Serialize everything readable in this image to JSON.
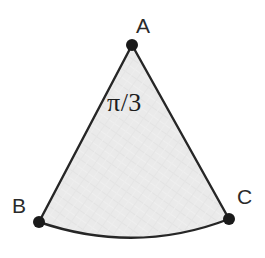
{
  "figure": {
    "kind": "circular-sector",
    "background_color": "#ffffff",
    "fill_color": "#e9e9e9",
    "stroke_color": "#262626",
    "stroke_width": 2.4,
    "vertex_dot_color": "#1a1a1a",
    "vertex_dot_radius": 6,
    "apex": {
      "label": "A",
      "x": 132,
      "y": 45
    },
    "arc_start": {
      "label": "B",
      "x": 39,
      "y": 222
    },
    "arc_end": {
      "label": "C",
      "x": 229,
      "y": 219
    },
    "arc_sagitta": 20,
    "arc_bottom_y": 241,
    "angle_label": "π/3",
    "path_d": "M 132 45 L 39 222 Q 136 255 229 219 Z"
  },
  "labels": {
    "apex": "A",
    "left": "B",
    "right": "C",
    "angle": "π/3"
  }
}
